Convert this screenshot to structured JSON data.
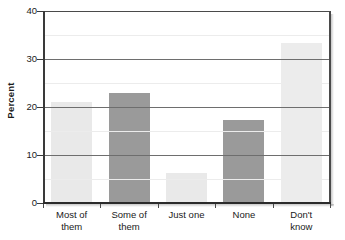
{
  "chart_data": {
    "type": "bar",
    "title": "",
    "subtitle": "",
    "xlabel": "",
    "ylabel": "Percent",
    "ylim": [
      0,
      40
    ],
    "xlim": null,
    "grid": true,
    "legend": null,
    "categories": [
      "Most of them",
      "Some of them",
      "Just one",
      "None",
      "Don't know"
    ],
    "category_lines": [
      [
        "Most of",
        "them"
      ],
      [
        "Some of",
        "them"
      ],
      [
        "Just one",
        ""
      ],
      [
        "None",
        ""
      ],
      [
        "Don't",
        "know"
      ]
    ],
    "values": [
      21.0,
      23.0,
      6.3,
      17.3,
      33.3
    ],
    "bar_colors": [
      "#e9e9e9",
      "#9a9a9a",
      "#e9e9e9",
      "#9a9a9a",
      "#ececec"
    ],
    "y_ticks": [
      0,
      10,
      20,
      30,
      40
    ],
    "y_tick_labels": [
      "0",
      "10",
      "20",
      "30",
      "40"
    ],
    "y_minor_ticks": [
      5,
      15,
      25,
      35
    ],
    "axis_color": "#3a3a3a",
    "gridline_color": "#6e6e6e",
    "minor_gridline_color": "#ececec",
    "text_color": "#1a1a1a",
    "background": "#ffffff"
  }
}
